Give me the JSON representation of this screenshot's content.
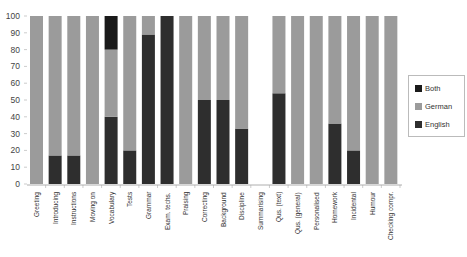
{
  "chart_data": {
    "type": "bar",
    "stacked": true,
    "title": "",
    "xlabel": "",
    "ylabel": "",
    "ylim": [
      0,
      100
    ],
    "yticks": [
      0,
      10,
      20,
      30,
      40,
      50,
      60,
      70,
      80,
      90,
      100
    ],
    "grid": false,
    "legend_position": "right",
    "categories": [
      "Greeting",
      "Introducing",
      "Instructions",
      "Moving on",
      "Vocabulary",
      "Tests",
      "Grammar",
      "Exam. techs.",
      "Praising",
      "Correcting",
      "Background",
      "Discipline",
      "Summarising",
      "Qus. (text)",
      "Qus. (general)",
      "Personalised",
      "Homework",
      "Incidental",
      "Humour",
      "Checking compr."
    ],
    "series": [
      {
        "name": "English",
        "color": "#2e2e2e",
        "values": [
          0,
          17,
          17,
          0,
          40,
          20,
          89,
          100,
          0,
          50,
          50,
          33,
          0,
          54,
          0,
          0,
          36,
          20,
          0,
          0
        ]
      },
      {
        "name": "German",
        "color": "#9b9b9b",
        "values": [
          100,
          83,
          83,
          100,
          40,
          80,
          11,
          0,
          100,
          50,
          50,
          67,
          0,
          46,
          100,
          100,
          64,
          80,
          100,
          100
        ]
      },
      {
        "name": "Both",
        "color": "#1a1a1a",
        "values": [
          0,
          0,
          0,
          0,
          20,
          0,
          0,
          0,
          0,
          0,
          0,
          0,
          0,
          0,
          0,
          0,
          0,
          0,
          0,
          0
        ]
      }
    ]
  },
  "legend": {
    "items": [
      {
        "label": "Both",
        "color": "#1a1a1a"
      },
      {
        "label": "German",
        "color": "#9b9b9b"
      },
      {
        "label": "English",
        "color": "#2e2e2e"
      }
    ]
  }
}
